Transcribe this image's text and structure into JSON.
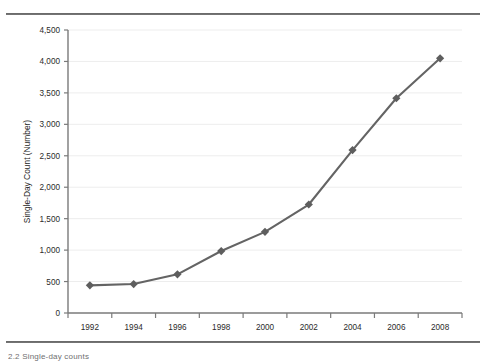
{
  "figure": {
    "caption_fragment": "2.2  Single-day counts",
    "rules": {
      "top_label": "top-divider-rule",
      "bottom_label": "bottom-divider-rule"
    }
  },
  "chart_data": {
    "type": "line",
    "title": "",
    "xlabel": "",
    "ylabel": "Single-Day Count (Number)",
    "categories": [
      "1992",
      "1994",
      "1996",
      "1998",
      "2000",
      "2002",
      "2004",
      "2006",
      "2008"
    ],
    "x": [
      1992,
      1994,
      1996,
      1998,
      2000,
      2002,
      2004,
      2006,
      2008
    ],
    "values": [
      440,
      460,
      615,
      985,
      1290,
      1725,
      2590,
      3415,
      4050
    ],
    "series": [
      {
        "name": "Single-Day Count",
        "values": [
          440,
          460,
          615,
          985,
          1290,
          1725,
          2590,
          3415,
          4050
        ]
      }
    ],
    "ylim": [
      0,
      4500
    ],
    "xlim": [
      1991,
      2009
    ],
    "ytick_labels": [
      "0",
      "500",
      "1,000",
      "1,500",
      "2,000",
      "2,500",
      "3,000",
      "3,500",
      "4,000",
      "4,500"
    ],
    "ytick_values": [
      0,
      500,
      1000,
      1500,
      2000,
      2500,
      3000,
      3500,
      4000,
      4500
    ],
    "xtick_labels": [
      "1992",
      "1994",
      "1996",
      "1998",
      "2000",
      "2002",
      "2004",
      "2006",
      "2008"
    ],
    "grid": true,
    "grid_axis": "y",
    "legend": false,
    "legend_position": "none",
    "marker": "diamond",
    "colors": {
      "line": "#646464",
      "marker": "#5e5e5e",
      "grid": "#ededed",
      "axis": "#7a7a7a",
      "text": "#2b2b2b",
      "rule": "#4d4d4d",
      "background": "#ffffff"
    }
  }
}
